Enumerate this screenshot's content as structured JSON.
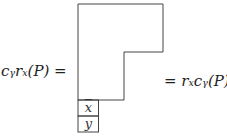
{
  "left_expr": "cᵧrₓ(P) =",
  "right_expr": "= rₓcᵧ(P)",
  "cells": [
    {
      "label": "x",
      "overline": true
    },
    {
      "label": "y",
      "overline": false
    }
  ]
}
